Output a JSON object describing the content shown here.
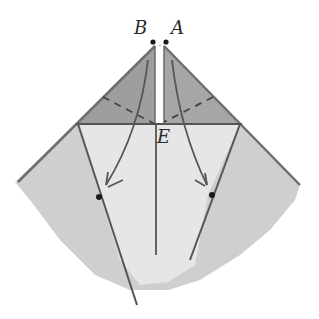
{
  "diagram": {
    "type": "origami-fold-step",
    "labels": {
      "point_b": "B",
      "point_a": "A",
      "point_e": "E"
    },
    "colors": {
      "background": "#ffffff",
      "paper_dark": "#a8a8a8",
      "paper_mid": "#c9c9c9",
      "paper_light": "#e4e4e4",
      "line": "#555555",
      "dot": "#1a1a1a"
    }
  }
}
